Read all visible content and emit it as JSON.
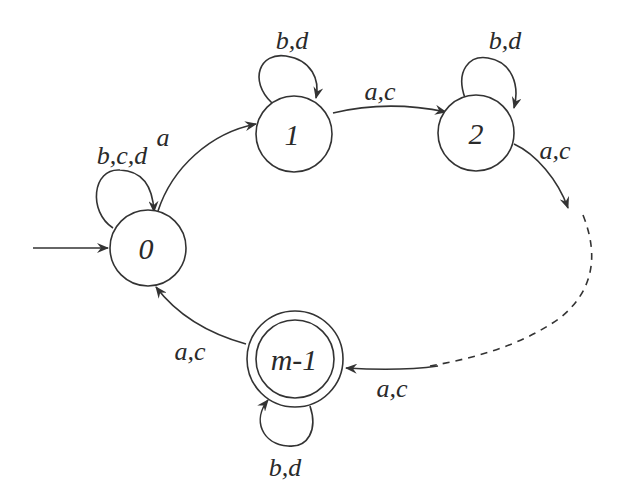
{
  "diagram": {
    "type": "finite-automaton",
    "colors": {
      "stroke": "#333333",
      "text": "#2a2a2a",
      "background": "#ffffff"
    },
    "states": [
      {
        "id": "s0",
        "label": "0",
        "initial": true,
        "accepting": false
      },
      {
        "id": "s1",
        "label": "1",
        "initial": false,
        "accepting": false
      },
      {
        "id": "s2",
        "label": "2",
        "initial": false,
        "accepting": false
      },
      {
        "id": "sm1",
        "label": "m-1",
        "initial": false,
        "accepting": true
      }
    ],
    "transitions": [
      {
        "from": "0",
        "to": "0",
        "label": "b,c,d"
      },
      {
        "from": "0",
        "to": "1",
        "label": "a"
      },
      {
        "from": "1",
        "to": "1",
        "label": "b,d"
      },
      {
        "from": "1",
        "to": "2",
        "label": "a,c"
      },
      {
        "from": "2",
        "to": "2",
        "label": "b,d"
      },
      {
        "from": "2",
        "to": "…",
        "label": "a,c"
      },
      {
        "from": "…",
        "to": "m-1",
        "label": "a,c"
      },
      {
        "from": "m-1",
        "to": "m-1",
        "label": "b,d"
      },
      {
        "from": "m-1",
        "to": "0",
        "label": "a,c"
      }
    ],
    "edge_labels": {
      "loop0": "b,c,d",
      "e01": "a",
      "loop1": "b,d",
      "e12": "a,c",
      "loop2": "b,d",
      "e2dots": "a,c",
      "edots_m1": "a,c",
      "loopm1": "b,d",
      "em10": "a,c"
    }
  }
}
